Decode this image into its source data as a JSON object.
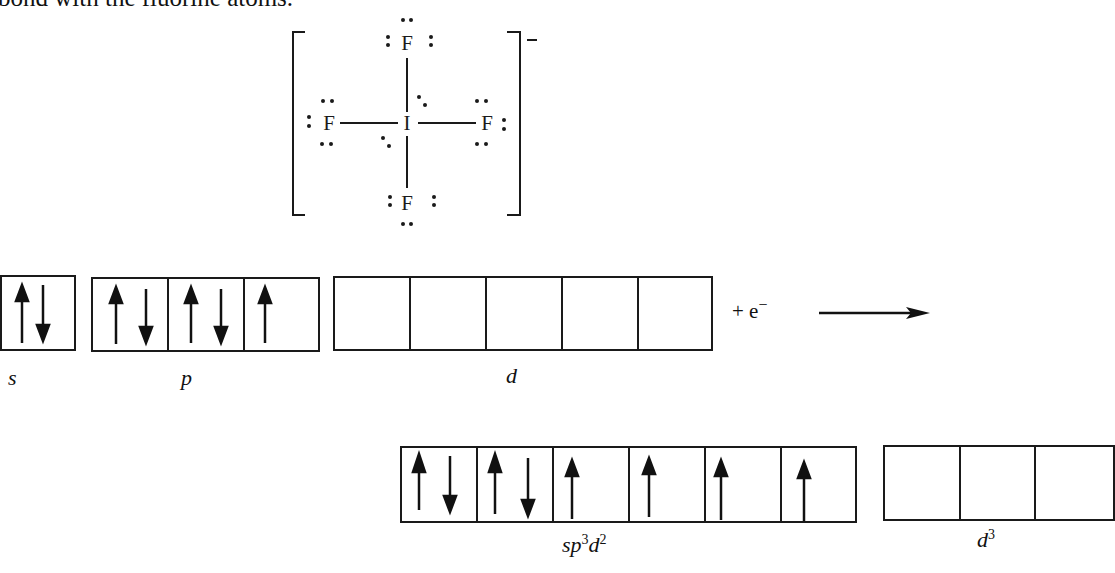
{
  "text": {
    "top_line": "bond with the fluorine atoms."
  },
  "lewis_structure": {
    "central_atom": "I",
    "ligands": [
      "F",
      "F",
      "F",
      "F"
    ],
    "charge": "−",
    "geometry": "square planar",
    "central_lone_pairs": 2,
    "ligand_lone_pairs_each": 3
  },
  "orbital_diagram": {
    "ground_state": [
      {
        "label": "s",
        "cells": [
          [
            "up",
            "down"
          ]
        ]
      },
      {
        "label": "p",
        "cells": [
          [
            "up",
            "down"
          ],
          [
            "up",
            "down"
          ],
          [
            "up"
          ]
        ]
      },
      {
        "label": "d",
        "cells": [
          [],
          [],
          [],
          [],
          []
        ]
      }
    ],
    "added": "+ e",
    "added_sup": "−",
    "arrow": "reaction-arrow",
    "hybridized": [
      {
        "label": "sp",
        "sup1": "3",
        "mid": "d",
        "sup2": "2",
        "cells": [
          [
            "up",
            "down"
          ],
          [
            "up",
            "down"
          ],
          [
            "up"
          ],
          [
            "up"
          ],
          [
            "up"
          ],
          [
            "up"
          ]
        ]
      },
      {
        "label": "d",
        "sup1": "3",
        "cells": [
          [],
          [],
          []
        ]
      }
    ]
  }
}
